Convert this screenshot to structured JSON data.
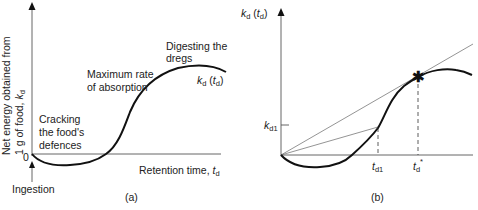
{
  "panel_a": {
    "caption": "(a)",
    "y_axis_label_line1": "Net energy obtained from",
    "y_axis_label_line2_prefix": "1 g of food, ",
    "y_axis_symbol": "k",
    "y_axis_symbol_sub": "d",
    "origin_label": "0",
    "x_axis_label_prefix": "Retention time, ",
    "x_axis_symbol": "t",
    "x_axis_symbol_sub": "d",
    "ingestion_label": "Ingestion",
    "annotations": {
      "cracking_line1": "Cracking",
      "cracking_line2": "the food's",
      "cracking_line3": "defences",
      "max_rate_line1": "Maximum rate",
      "max_rate_line2": "of absorption",
      "dregs_line1": "Digesting the",
      "dregs_line2": "dregs"
    },
    "curve_label": {
      "k": "k",
      "k_sub": "d",
      "open": " (",
      "t": "t",
      "t_sub": "d",
      "close": ")"
    }
  },
  "panel_b": {
    "caption": "(b)",
    "y_axis_label": {
      "k": "k",
      "k_sub": "d",
      "open": " (",
      "t": "t",
      "t_sub": "d",
      "close": ")"
    },
    "y_tick_label": {
      "k": "k",
      "k_sub": "d1"
    },
    "x_tick_1": {
      "t": "t",
      "t_sub": "d1"
    },
    "x_tick_2": {
      "t": "t",
      "t_sub": "d",
      "sup": "*"
    },
    "optimum_marker": "✱"
  }
}
